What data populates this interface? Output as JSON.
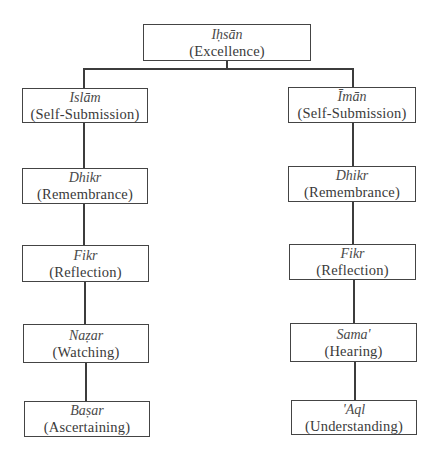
{
  "diagram": {
    "type": "tree",
    "root": {
      "term": "Iḥsān",
      "gloss": "(Excellence)"
    },
    "branches": [
      {
        "side": "left",
        "nodes": [
          {
            "term": "Islām",
            "gloss": "(Self-Submission)"
          },
          {
            "term": "Dhikr",
            "gloss": "(Remembrance)"
          },
          {
            "term": "Fikr",
            "gloss": "(Reflection)"
          },
          {
            "term": "Naẓar",
            "gloss": "(Watching)"
          },
          {
            "term": "Baṣar",
            "gloss": "(Ascertaining)"
          }
        ]
      },
      {
        "side": "right",
        "nodes": [
          {
            "term": "Īmān",
            "gloss": "(Self-Submission)"
          },
          {
            "term": "Dhikr",
            "gloss": "(Remembrance)"
          },
          {
            "term": "Fikr",
            "gloss": "(Reflection)"
          },
          {
            "term": "Sama'",
            "gloss": "(Hearing)"
          },
          {
            "term": "'Aql",
            "gloss": "(Understanding)"
          }
        ]
      }
    ],
    "colors": {
      "line": "#3c3c3c",
      "border": "#444444",
      "background": "#ffffff",
      "text": "#3a3a3a"
    }
  }
}
